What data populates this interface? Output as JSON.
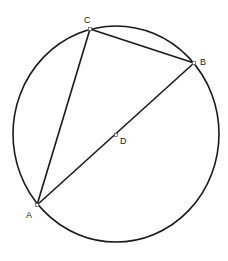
{
  "diagram": {
    "type": "circle-inscribed-triangle",
    "circle": {
      "center": "D",
      "cx": 116,
      "cy": 134,
      "rx": 103,
      "ry": 108
    },
    "points": [
      {
        "name": "A",
        "x": 37,
        "y": 205,
        "label_x": 26,
        "label_y": 218
      },
      {
        "name": "B",
        "x": 194,
        "y": 63,
        "label_x": 200,
        "label_y": 65
      },
      {
        "name": "C",
        "x": 90,
        "y": 29,
        "label_x": 84,
        "label_y": 23
      },
      {
        "name": "D",
        "x": 116,
        "y": 135,
        "label_x": 120,
        "label_y": 144
      }
    ],
    "segments": [
      [
        "A",
        "C"
      ],
      [
        "C",
        "B"
      ],
      [
        "B",
        "A"
      ]
    ],
    "colors": {
      "stroke": "#1a1a1a",
      "point_fill": "#ffffff"
    }
  }
}
